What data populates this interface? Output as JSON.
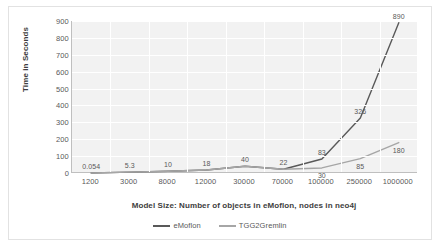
{
  "chart_data": {
    "type": "line",
    "title": "",
    "xlabel": "Model Size: Number of objects in eMoflon, nodes in neo4j",
    "ylabel": "Time in Seconds",
    "categories": [
      "1200",
      "3000",
      "8000",
      "12000",
      "30000",
      "70000",
      "100000",
      "250000",
      "1000000"
    ],
    "ylim": [
      0,
      900
    ],
    "yticks": [
      0,
      100,
      200,
      300,
      400,
      500,
      600,
      700,
      800,
      900
    ],
    "grid": true,
    "legend_position": "bottom",
    "series": [
      {
        "name": "eMoflon",
        "color": "#595959",
        "values": [
          0.054,
          5.3,
          10,
          18,
          40,
          22,
          83,
          326,
          890
        ],
        "labels": [
          "0.054",
          "5.3",
          "10",
          "18",
          "40",
          "22",
          "83",
          "326",
          "890"
        ]
      },
      {
        "name": "TGG2Gremlin",
        "color": "#a6a6a6",
        "values": [
          0.054,
          5.3,
          10,
          18,
          40,
          22,
          30,
          85,
          180
        ],
        "labels": [
          "0.054",
          "5.3",
          "10",
          "18",
          "40",
          "22",
          "30",
          "85",
          "180"
        ]
      }
    ]
  },
  "colors": {
    "plot_background": "#f2f2f2",
    "gridline": "#ffffff",
    "axis": "#bfbfbf",
    "text": "#595959",
    "series_primary": "#595959",
    "series_secondary": "#a6a6a6"
  }
}
